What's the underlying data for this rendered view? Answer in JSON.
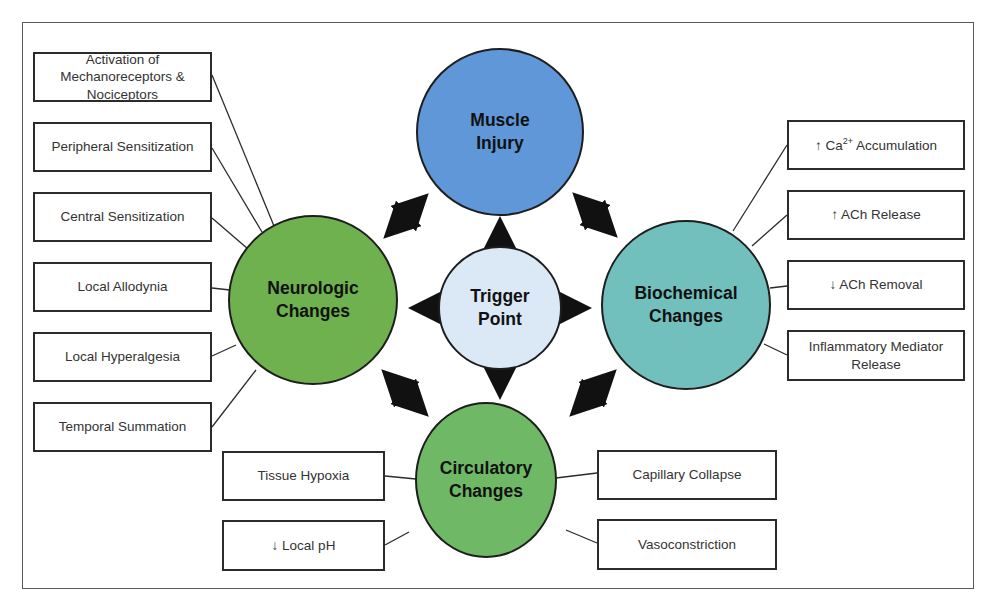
{
  "diagram": {
    "center": {
      "label_line1": "Trigger",
      "label_line2": "Point",
      "color": "#dbe8f6"
    },
    "nodes": {
      "muscle_injury": {
        "label_line1": "Muscle",
        "label_line2": "Injury",
        "color": "#5f97d8"
      },
      "neurologic": {
        "label_line1": "Neurologic",
        "label_line2": "Changes",
        "color": "#6fb04f"
      },
      "biochemical": {
        "label_line1": "Biochemical",
        "label_line2": "Changes",
        "color": "#72c0be"
      },
      "circulatory": {
        "label_line1": "Circulatory",
        "label_line2": "Changes",
        "color": "#6fb865"
      }
    },
    "neurologic_items": [
      {
        "line1": "Activation of",
        "line2": "Mechanoreceptors &",
        "line3": "Nociceptors"
      },
      {
        "line1": "Peripheral Sensitization"
      },
      {
        "line1": "Central Sensitization"
      },
      {
        "line1": "Local Allodynia"
      },
      {
        "line1": "Local Hyperalgesia"
      },
      {
        "line1": "Temporal Summation"
      }
    ],
    "biochemical_items": [
      {
        "prefix": "↑ Ca",
        "sup": "2+",
        "suffix": " Accumulation"
      },
      {
        "line1": "↑ ACh Release"
      },
      {
        "line1": "↓ ACh Removal"
      },
      {
        "line1": "Inflammatory Mediator",
        "line2": "Release"
      }
    ],
    "circulatory_items": {
      "left": [
        {
          "line1": "Tissue Hypoxia"
        },
        {
          "line1": "↓ Local pH"
        }
      ],
      "right": [
        {
          "line1": "Capillary Collapse"
        },
        {
          "line1": "Vasoconstriction"
        }
      ]
    },
    "arrow_color": "#111111",
    "box_border_color": "#2b2b2b"
  }
}
